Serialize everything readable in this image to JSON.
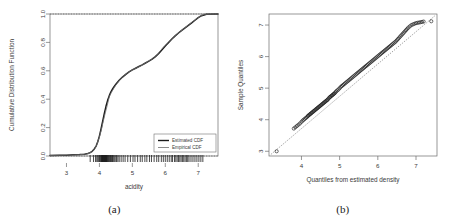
{
  "figure": {
    "panels": [
      {
        "caption": "(a)"
      },
      {
        "caption": "(b)"
      }
    ]
  },
  "chart_data": [
    {
      "type": "line",
      "panel": "(a)",
      "title": "",
      "xlabel": "acidity",
      "ylabel": "Cumulative Distribution Function",
      "xlim": [
        2.5,
        7.6
      ],
      "ylim": [
        0.0,
        1.0
      ],
      "xticks": [
        3,
        4,
        5,
        6,
        7
      ],
      "yticks": [
        "0.0",
        "0.2",
        "0.4",
        "0.6",
        "0.8",
        "1.0"
      ],
      "ytick_values": [
        0.0,
        0.2,
        0.4,
        0.6,
        0.8,
        1.0
      ],
      "grid": false,
      "legend": {
        "position": "bottom-right",
        "entries": [
          {
            "label": "Estimated CDF",
            "color": "#1a1a1a",
            "style": "solid"
          },
          {
            "label": "Empirical CDF",
            "color": "#6e6e6e",
            "style": "solid"
          }
        ]
      },
      "series": [
        {
          "name": "Estimated CDF",
          "color": "#1a1a1a",
          "x": [
            2.5,
            2.8,
            3.0,
            3.2,
            3.4,
            3.55,
            3.65,
            3.72,
            3.78,
            3.84,
            3.9,
            3.95,
            4.0,
            4.05,
            4.1,
            4.15,
            4.2,
            4.25,
            4.3,
            4.35,
            4.4,
            4.45,
            4.5,
            4.55,
            4.6,
            4.7,
            4.8,
            4.9,
            5.0,
            5.1,
            5.2,
            5.3,
            5.4,
            5.5,
            5.6,
            5.7,
            5.8,
            5.9,
            6.0,
            6.1,
            6.2,
            6.3,
            6.4,
            6.5,
            6.6,
            6.7,
            6.8,
            6.9,
            7.0,
            7.1,
            7.25,
            7.6
          ],
          "y": [
            0.004,
            0.005,
            0.006,
            0.008,
            0.01,
            0.013,
            0.018,
            0.024,
            0.033,
            0.048,
            0.07,
            0.1,
            0.14,
            0.19,
            0.245,
            0.3,
            0.35,
            0.392,
            0.425,
            0.452,
            0.472,
            0.49,
            0.505,
            0.52,
            0.533,
            0.556,
            0.575,
            0.592,
            0.606,
            0.618,
            0.63,
            0.642,
            0.655,
            0.668,
            0.682,
            0.7,
            0.722,
            0.748,
            0.775,
            0.8,
            0.824,
            0.846,
            0.866,
            0.885,
            0.902,
            0.92,
            0.938,
            0.956,
            0.974,
            0.988,
            0.998,
            1.0
          ]
        },
        {
          "name": "Empirical CDF",
          "color": "#757575",
          "x": [
            2.5,
            3.0,
            3.4,
            3.6,
            3.7,
            3.78,
            3.86,
            3.93,
            4.0,
            4.06,
            4.12,
            4.18,
            4.24,
            4.3,
            4.36,
            4.42,
            4.48,
            4.55,
            4.62,
            4.72,
            4.82,
            4.92,
            5.02,
            5.14,
            5.26,
            5.38,
            5.5,
            5.62,
            5.74,
            5.86,
            5.98,
            6.1,
            6.22,
            6.34,
            6.46,
            6.58,
            6.7,
            6.82,
            6.94,
            7.06,
            7.18,
            7.6
          ],
          "y": [
            0.004,
            0.006,
            0.009,
            0.014,
            0.02,
            0.031,
            0.052,
            0.085,
            0.135,
            0.185,
            0.248,
            0.305,
            0.358,
            0.418,
            0.446,
            0.47,
            0.494,
            0.514,
            0.536,
            0.562,
            0.58,
            0.596,
            0.609,
            0.622,
            0.636,
            0.652,
            0.67,
            0.686,
            0.71,
            0.744,
            0.776,
            0.802,
            0.83,
            0.856,
            0.878,
            0.9,
            0.922,
            0.944,
            0.966,
            0.984,
            0.998,
            1.0
          ]
        }
      ],
      "reference_line": {
        "y": 1.0,
        "style": "dotted",
        "color": "#555555"
      },
      "baseline": {
        "y": 0.0,
        "style": "dotted",
        "color": "#555555"
      },
      "rug": {
        "label": "rug-plot",
        "values": [
          3.72,
          3.82,
          3.88,
          3.92,
          3.95,
          3.98,
          4.0,
          4.02,
          4.04,
          4.06,
          4.07,
          4.08,
          4.09,
          4.1,
          4.11,
          4.12,
          4.13,
          4.14,
          4.15,
          4.16,
          4.17,
          4.18,
          4.19,
          4.2,
          4.21,
          4.22,
          4.23,
          4.25,
          4.26,
          4.28,
          4.3,
          4.32,
          4.34,
          4.36,
          4.38,
          4.4,
          4.42,
          4.45,
          4.48,
          4.52,
          4.56,
          4.6,
          4.66,
          4.72,
          4.78,
          4.86,
          4.94,
          5.02,
          5.08,
          5.16,
          5.24,
          5.3,
          5.38,
          5.44,
          5.52,
          5.58,
          5.66,
          5.74,
          5.8,
          5.88,
          5.94,
          6.0,
          6.06,
          6.12,
          6.18,
          6.22,
          6.28,
          6.32,
          6.36,
          6.4,
          6.44,
          6.48,
          6.52,
          6.56,
          6.6,
          6.64,
          6.68,
          6.72,
          6.78,
          6.84,
          6.9,
          6.96,
          7.02,
          7.08,
          7.14
        ]
      }
    },
    {
      "type": "scatter",
      "panel": "(b)",
      "title": "",
      "xlabel": "Quantiles from estimated density",
      "ylabel": "Sample Quantiles",
      "xlim": [
        3.15,
        7.55
      ],
      "ylim": [
        2.85,
        7.35
      ],
      "xticks": [
        4,
        5,
        6,
        7
      ],
      "yticks": [
        3,
        4,
        5,
        6,
        7
      ],
      "grid": false,
      "marker": {
        "shape": "circle-open",
        "size": 1.6,
        "color": "#1a1a1a"
      },
      "reference_line": {
        "style": "dotted",
        "color": "#777777",
        "from": [
          3.2,
          2.9
        ],
        "to": [
          7.5,
          7.3
        ]
      },
      "points_x": [
        3.35,
        3.8,
        3.84,
        3.88,
        3.92,
        3.96,
        4.0,
        4.03,
        4.06,
        4.09,
        4.12,
        4.15,
        4.17,
        4.19,
        4.21,
        4.23,
        4.25,
        4.27,
        4.29,
        4.31,
        4.33,
        4.35,
        4.37,
        4.39,
        4.41,
        4.43,
        4.45,
        4.47,
        4.49,
        4.51,
        4.53,
        4.55,
        4.57,
        4.59,
        4.61,
        4.63,
        4.65,
        4.67,
        4.69,
        4.71,
        4.73,
        4.75,
        4.77,
        4.79,
        4.81,
        4.83,
        4.85,
        4.87,
        4.89,
        4.91,
        4.94,
        4.97,
        5.0,
        5.03,
        5.06,
        5.09,
        5.12,
        5.15,
        5.18,
        5.21,
        5.24,
        5.27,
        5.3,
        5.33,
        5.36,
        5.39,
        5.42,
        5.45,
        5.48,
        5.51,
        5.54,
        5.57,
        5.6,
        5.63,
        5.66,
        5.69,
        5.72,
        5.75,
        5.78,
        5.81,
        5.84,
        5.87,
        5.9,
        5.93,
        5.96,
        5.99,
        6.02,
        6.05,
        6.08,
        6.11,
        6.14,
        6.17,
        6.2,
        6.23,
        6.26,
        6.29,
        6.32,
        6.35,
        6.38,
        6.41,
        6.44,
        6.47,
        6.5,
        6.53,
        6.56,
        6.59,
        6.62,
        6.65,
        6.68,
        6.71,
        6.74,
        6.77,
        6.8,
        6.84,
        6.88,
        6.92,
        6.96,
        7.0,
        7.04,
        7.08,
        7.12,
        7.16,
        7.2,
        7.4
      ],
      "points_y": [
        3.0,
        3.72,
        3.76,
        3.8,
        3.84,
        3.88,
        3.93,
        3.97,
        4.0,
        4.03,
        4.06,
        4.09,
        4.12,
        4.14,
        4.16,
        4.18,
        4.2,
        4.22,
        4.24,
        4.26,
        4.28,
        4.3,
        4.32,
        4.34,
        4.36,
        4.38,
        4.4,
        4.42,
        4.44,
        4.46,
        4.48,
        4.5,
        4.52,
        4.54,
        4.56,
        4.58,
        4.6,
        4.62,
        4.64,
        4.67,
        4.7,
        4.72,
        4.74,
        4.76,
        4.78,
        4.8,
        4.82,
        4.84,
        4.87,
        4.9,
        4.93,
        4.96,
        5.0,
        5.04,
        5.07,
        5.1,
        5.13,
        5.16,
        5.19,
        5.22,
        5.25,
        5.28,
        5.31,
        5.34,
        5.37,
        5.4,
        5.43,
        5.46,
        5.49,
        5.52,
        5.55,
        5.58,
        5.61,
        5.64,
        5.67,
        5.7,
        5.73,
        5.76,
        5.79,
        5.82,
        5.85,
        5.88,
        5.91,
        5.94,
        5.97,
        6.0,
        6.03,
        6.06,
        6.09,
        6.12,
        6.15,
        6.18,
        6.21,
        6.24,
        6.27,
        6.3,
        6.33,
        6.36,
        6.39,
        6.42,
        6.45,
        6.48,
        6.52,
        6.56,
        6.6,
        6.64,
        6.68,
        6.72,
        6.76,
        6.8,
        6.84,
        6.88,
        6.92,
        6.96,
        7.0,
        7.02,
        7.04,
        7.06,
        7.07,
        7.08,
        7.09,
        7.1,
        7.11,
        7.12
      ]
    }
  ]
}
